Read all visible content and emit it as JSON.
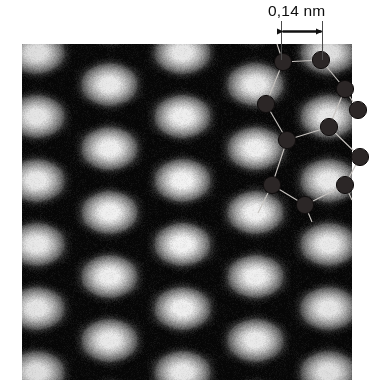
{
  "figure": {
    "kind": "stm-micrograph"
  },
  "scale_annotation": {
    "label": "0,14 nm",
    "arrow_name": "double-headed-arrow",
    "arrow_x_start": 281,
    "arrow_x_end": 322,
    "arrow_y": 31,
    "tick_color": "#4a4a4a",
    "text_color": "#0d0d0d"
  },
  "stm_image": {
    "x": 22,
    "y": 44,
    "width": 330,
    "height": 336,
    "lattice_spacing_x": 73,
    "lattice_spacing_y": 64,
    "dark_color": "#060606",
    "bright_color": "#f2f2f2",
    "mid_color": "#8a8a8a"
  },
  "overlay": {
    "atom_color": "#2b2626",
    "atom_edge_color": "#100d0d",
    "bond_color": "#c8c4c0",
    "atom_radius": 8.6,
    "bond_width": 1.1,
    "atoms": [
      {
        "name": "atom-1",
        "x": 283,
        "y": 62
      },
      {
        "name": "atom-2",
        "x": 321,
        "y": 60
      },
      {
        "name": "atom-3",
        "x": 345,
        "y": 89
      },
      {
        "name": "atom-4",
        "x": 266,
        "y": 104
      },
      {
        "name": "atom-5",
        "x": 329,
        "y": 127
      },
      {
        "name": "atom-6",
        "x": 287,
        "y": 140
      },
      {
        "name": "atom-7",
        "x": 360,
        "y": 157
      },
      {
        "name": "atom-8",
        "x": 345,
        "y": 185
      },
      {
        "name": "atom-9",
        "x": 272,
        "y": 185
      },
      {
        "name": "atom-10",
        "x": 305,
        "y": 205
      },
      {
        "name": "atom-11",
        "x": 358,
        "y": 110
      }
    ],
    "bonds": [
      {
        "name": "bond-1-2",
        "from": 0,
        "to": 1
      },
      {
        "name": "bond-2-3",
        "from": 1,
        "to": 2
      },
      {
        "name": "bond-1-4",
        "from": 0,
        "to": 3
      },
      {
        "name": "bond-3-5",
        "from": 2,
        "to": 4
      },
      {
        "name": "bond-4-6",
        "from": 3,
        "to": 5
      },
      {
        "name": "bond-5-6",
        "from": 4,
        "to": 5
      },
      {
        "name": "bond-5-7",
        "from": 4,
        "to": 6
      },
      {
        "name": "bond-6-9",
        "from": 5,
        "to": 8
      },
      {
        "name": "bond-7-8",
        "from": 6,
        "to": 7
      },
      {
        "name": "bond-8-10",
        "from": 7,
        "to": 9
      },
      {
        "name": "bond-9-10",
        "from": 8,
        "to": 9
      },
      {
        "name": "bond-3-11",
        "from": 2,
        "to": 10
      }
    ],
    "stubs": [
      {
        "name": "stub-top-1",
        "x1": 283,
        "y1": 62,
        "x2": 277,
        "y2": 44
      },
      {
        "name": "stub-top-2",
        "x1": 321,
        "y1": 60,
        "x2": 323,
        "y2": 44
      },
      {
        "name": "stub-bottom-1",
        "x1": 272,
        "y1": 185,
        "x2": 258,
        "y2": 213
      },
      {
        "name": "stub-bottom-2",
        "x1": 305,
        "y1": 205,
        "x2": 312,
        "y2": 222
      },
      {
        "name": "stub-bottom-3",
        "x1": 345,
        "y1": 185,
        "x2": 352,
        "y2": 200
      }
    ]
  }
}
